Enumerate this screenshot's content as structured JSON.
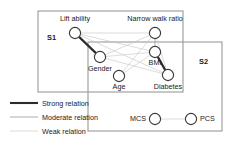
{
  "figure": {
    "title": "",
    "type": "network-graph"
  },
  "groups": [
    {
      "id": "S1",
      "label": "S1",
      "x": 38,
      "y": 11,
      "w": 145,
      "h": 81,
      "label_x": 47,
      "label_y": 40
    },
    {
      "id": "S2",
      "label": "S2",
      "x": 88,
      "y": 42,
      "w": 134,
      "h": 89,
      "label_x": 199,
      "label_y": 64
    }
  ],
  "nodes": [
    {
      "id": "lift_ability",
      "label": "Lift ability",
      "cx": 75,
      "cy": 33,
      "r": 5.6,
      "label_x": 75,
      "label_y": 21,
      "anchor": "middle"
    },
    {
      "id": "narrow_walk_ratio",
      "label": "Narrow walk ratio",
      "cx": 155,
      "cy": 33,
      "r": 5.6,
      "label_x": 155,
      "label_y": 21,
      "anchor": "middle"
    },
    {
      "id": "gender",
      "label": "Gender",
      "cx": 100,
      "cy": 57,
      "r": 5.6,
      "label_x": 100,
      "label_y": 71,
      "anchor": "middle"
    },
    {
      "id": "bmi",
      "label": "BMI",
      "cx": 155,
      "cy": 52,
      "r": 5.6,
      "label_x": 155,
      "label_y": 65,
      "anchor": "middle"
    },
    {
      "id": "age",
      "label": "Age",
      "cx": 119,
      "cy": 76,
      "r": 5.6,
      "label_x": 119,
      "label_y": 89,
      "anchor": "middle"
    },
    {
      "id": "diabetes",
      "label": "Diabetes",
      "cx": 168,
      "cy": 75,
      "r": 5.6,
      "label_x": 168,
      "label_y": 89,
      "anchor": "middle"
    },
    {
      "id": "mcs",
      "label": "MCS",
      "cx": 155,
      "cy": 119,
      "r": 5.6,
      "label_x": 146,
      "label_y": 121,
      "anchor": "end"
    },
    {
      "id": "pcs",
      "label": "PCS",
      "cx": 191,
      "cy": 119,
      "r": 5.6,
      "label_x": 200,
      "label_y": 121,
      "anchor": "start"
    }
  ],
  "edges": [
    {
      "from": "lift_ability",
      "to": "gender",
      "strength": "strong"
    },
    {
      "from": "bmi",
      "to": "diabetes",
      "strength": "strong"
    },
    {
      "from": "lift_ability",
      "to": "narrow_walk_ratio",
      "strength": "weak"
    },
    {
      "from": "lift_ability",
      "to": "bmi",
      "strength": "weak"
    },
    {
      "from": "lift_ability",
      "to": "diabetes",
      "strength": "weak"
    },
    {
      "from": "narrow_walk_ratio",
      "to": "bmi",
      "strength": "moderate"
    },
    {
      "from": "narrow_walk_ratio",
      "to": "gender",
      "strength": "weak"
    },
    {
      "from": "narrow_walk_ratio",
      "to": "age",
      "strength": "weak"
    },
    {
      "from": "narrow_walk_ratio",
      "to": "diabetes",
      "strength": "weak"
    },
    {
      "from": "gender",
      "to": "bmi",
      "strength": "weak"
    },
    {
      "from": "gender",
      "to": "diabetes",
      "strength": "weak"
    },
    {
      "from": "age",
      "to": "bmi",
      "strength": "weak"
    },
    {
      "from": "mcs",
      "to": "pcs",
      "strength": "weak"
    }
  ],
  "legend": {
    "items": [
      {
        "id": "strong",
        "label": "Strong relation",
        "strength": "strong",
        "x1": 10,
        "x2": 38,
        "y": 103,
        "label_x": 42
      },
      {
        "id": "moderate",
        "label": "Moderate relation",
        "strength": "moderate",
        "x1": 10,
        "x2": 38,
        "y": 117,
        "label_x": 42
      },
      {
        "id": "weak",
        "label": "Weak relation",
        "strength": "weak",
        "x1": 10,
        "x2": 38,
        "y": 131,
        "label_x": 42
      }
    ]
  },
  "colors": {
    "strong": "#2b2b2b",
    "moderate": "#9d9d9d",
    "weak": "#c4c4c4",
    "node_stroke": "#3a3a3a",
    "box_stroke": "#9a9a9a",
    "background": "#ffffff"
  }
}
